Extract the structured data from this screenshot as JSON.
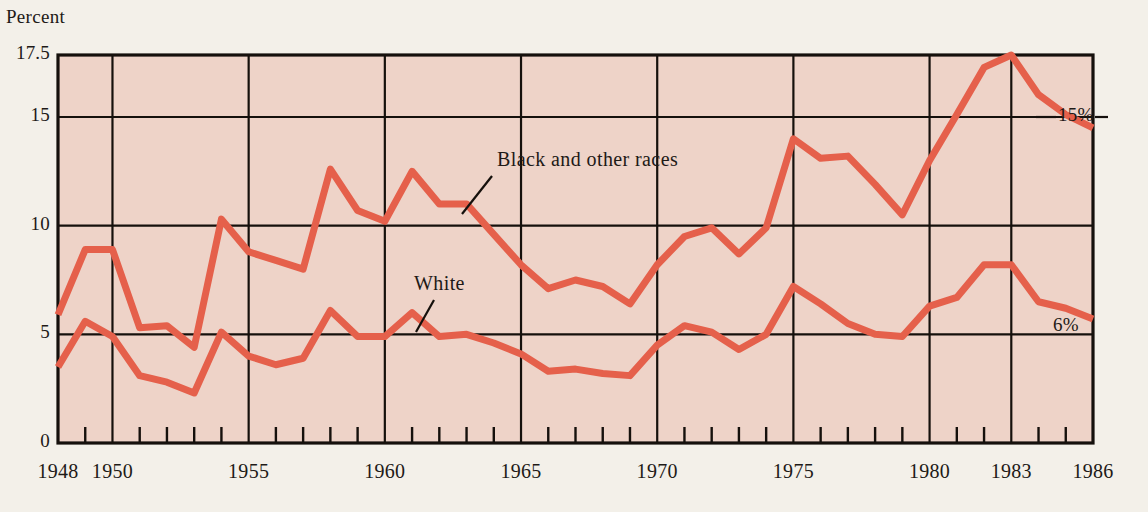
{
  "chart_data": {
    "type": "line",
    "title": "",
    "ylabel": "Percent",
    "xlabel": "",
    "ylim": [
      0,
      17.5
    ],
    "xlim": [
      1948,
      1986
    ],
    "grid": true,
    "legend": "inline-annotations",
    "ytick_labels": [
      "0",
      "5",
      "10",
      "15",
      "17.5"
    ],
    "ytick_values": [
      0,
      5,
      10,
      15,
      17.5
    ],
    "xtick_labels": [
      "1948",
      "1950",
      "1955",
      "1960",
      "1965",
      "1970",
      "1975",
      "1980",
      "1983",
      "1986"
    ],
    "xtick_values": [
      1948,
      1950,
      1955,
      1960,
      1965,
      1970,
      1975,
      1980,
      1983,
      1986
    ],
    "x": [
      1948,
      1949,
      1950,
      1951,
      1952,
      1953,
      1954,
      1955,
      1956,
      1957,
      1958,
      1959,
      1960,
      1961,
      1962,
      1963,
      1964,
      1965,
      1966,
      1967,
      1968,
      1969,
      1970,
      1971,
      1972,
      1973,
      1974,
      1975,
      1976,
      1977,
      1978,
      1979,
      1980,
      1981,
      1982,
      1983,
      1984,
      1985,
      1986
    ],
    "series": [
      {
        "name": "Black and other races",
        "color": "#e5604b",
        "values": [
          5.9,
          8.9,
          8.9,
          5.3,
          5.4,
          4.4,
          10.3,
          8.8,
          8.4,
          8.0,
          12.6,
          10.7,
          10.2,
          12.5,
          11.0,
          11.0,
          9.6,
          8.2,
          7.1,
          7.5,
          7.2,
          6.4,
          8.2,
          9.5,
          9.9,
          8.7,
          9.9,
          14.0,
          13.1,
          13.2,
          11.9,
          10.5,
          13.0,
          15.1,
          17.0,
          17.5,
          15.9,
          15.1,
          14.5
        ]
      },
      {
        "name": "White",
        "color": "#e5604b",
        "values": [
          3.5,
          5.6,
          4.9,
          3.1,
          2.8,
          2.3,
          5.1,
          4.0,
          3.6,
          3.9,
          6.1,
          4.9,
          4.9,
          6.0,
          4.9,
          5.0,
          4.6,
          4.1,
          3.3,
          3.4,
          3.2,
          3.1,
          4.5,
          5.4,
          5.1,
          4.3,
          5.0,
          7.2,
          6.4,
          5.5,
          5.0,
          4.9,
          6.3,
          6.7,
          8.2,
          8.2,
          6.5,
          6.2,
          5.7
        ]
      }
    ],
    "annotations": [
      {
        "text": "Black and other races",
        "points_to": "upper-series"
      },
      {
        "text": "White",
        "points_to": "lower-series"
      },
      {
        "text": "15%",
        "at_value": 15,
        "position": "right-edge"
      },
      {
        "text": "6%",
        "at_value": 6,
        "position": "right-edge"
      }
    ]
  }
}
